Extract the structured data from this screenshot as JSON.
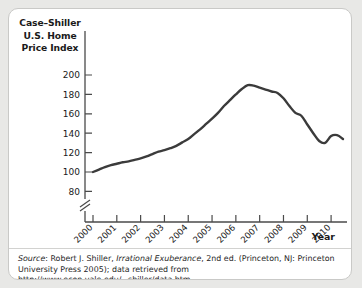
{
  "figure": {
    "background_color": "#ffffff",
    "page_background_color": "#e8e8e6",
    "border_color": "#c9c9c7"
  },
  "axis_title_y": {
    "line1": "Case–Shiller",
    "line2": "U.S. Home",
    "line3": "Price Index"
  },
  "axis_title_x": "Year",
  "source": {
    "prefix": "Source",
    "line1_a": ": Robert J. Shiller, ",
    "line1_italic": "Irrational Exuberance",
    "line1_b": ", 2nd ed. (Princeton, NJ: Princeton",
    "line2": "University Press 2005); data retrieved from http://www.econ.yale.edu/~shiller/data.htm."
  },
  "chart_data": {
    "type": "line",
    "title": "",
    "xlabel": "Year",
    "ylabel": "Case–Shiller U.S. Home Price Index",
    "xlim": [
      2000,
      2010.5
    ],
    "ylim": [
      70,
      205
    ],
    "grid": false,
    "legend": "none",
    "axis_break_y": true,
    "line_color": "#3b3b3b",
    "line_width": 2.4,
    "xticks": [
      2000,
      2001,
      2002,
      2003,
      2004,
      2005,
      2006,
      2007,
      2008,
      2009,
      2010
    ],
    "xtick_labels": [
      "2000",
      "2001",
      "2002",
      "2003",
      "2004",
      "2005",
      "2006",
      "2007",
      "2008",
      "2009",
      "2010"
    ],
    "yticks": [
      80,
      100,
      120,
      140,
      160,
      180,
      200
    ],
    "ytick_labels": [
      "80",
      "100",
      "120",
      "140",
      "160",
      "180",
      "200"
    ],
    "x": [
      2000.0,
      2000.25,
      2000.5,
      2000.75,
      2001.0,
      2001.25,
      2001.5,
      2001.75,
      2002.0,
      2002.25,
      2002.5,
      2002.75,
      2003.0,
      2003.25,
      2003.5,
      2003.75,
      2004.0,
      2004.25,
      2004.5,
      2004.75,
      2005.0,
      2005.25,
      2005.5,
      2005.75,
      2006.0,
      2006.25,
      2006.5,
      2006.75,
      2007.0,
      2007.25,
      2007.5,
      2007.75,
      2008.0,
      2008.25,
      2008.5,
      2008.75,
      2009.0,
      2009.25,
      2009.5,
      2009.75,
      2010.0,
      2010.25,
      2010.5
    ],
    "values": [
      100.0,
      102.5,
      105.0,
      107.0,
      108.5,
      110.0,
      111.0,
      112.5,
      114.0,
      116.0,
      118.5,
      121.0,
      122.5,
      124.5,
      127.0,
      130.5,
      134.0,
      139.0,
      144.0,
      149.5,
      155.0,
      161.0,
      168.0,
      174.0,
      180.0,
      185.5,
      189.5,
      189.0,
      187.0,
      185.0,
      183.0,
      181.5,
      176.0,
      168.0,
      161.0,
      158.0,
      149.0,
      140.0,
      132.0,
      130.0,
      137.0,
      138.0,
      134.0
    ],
    "series_name": "Case-Shiller U.S. Home Price Index",
    "peak": {
      "x": 2006.5,
      "value": 190
    },
    "start": {
      "x": 2000.0,
      "value": 100
    },
    "end": {
      "x": 2010.5,
      "value": 136
    }
  }
}
